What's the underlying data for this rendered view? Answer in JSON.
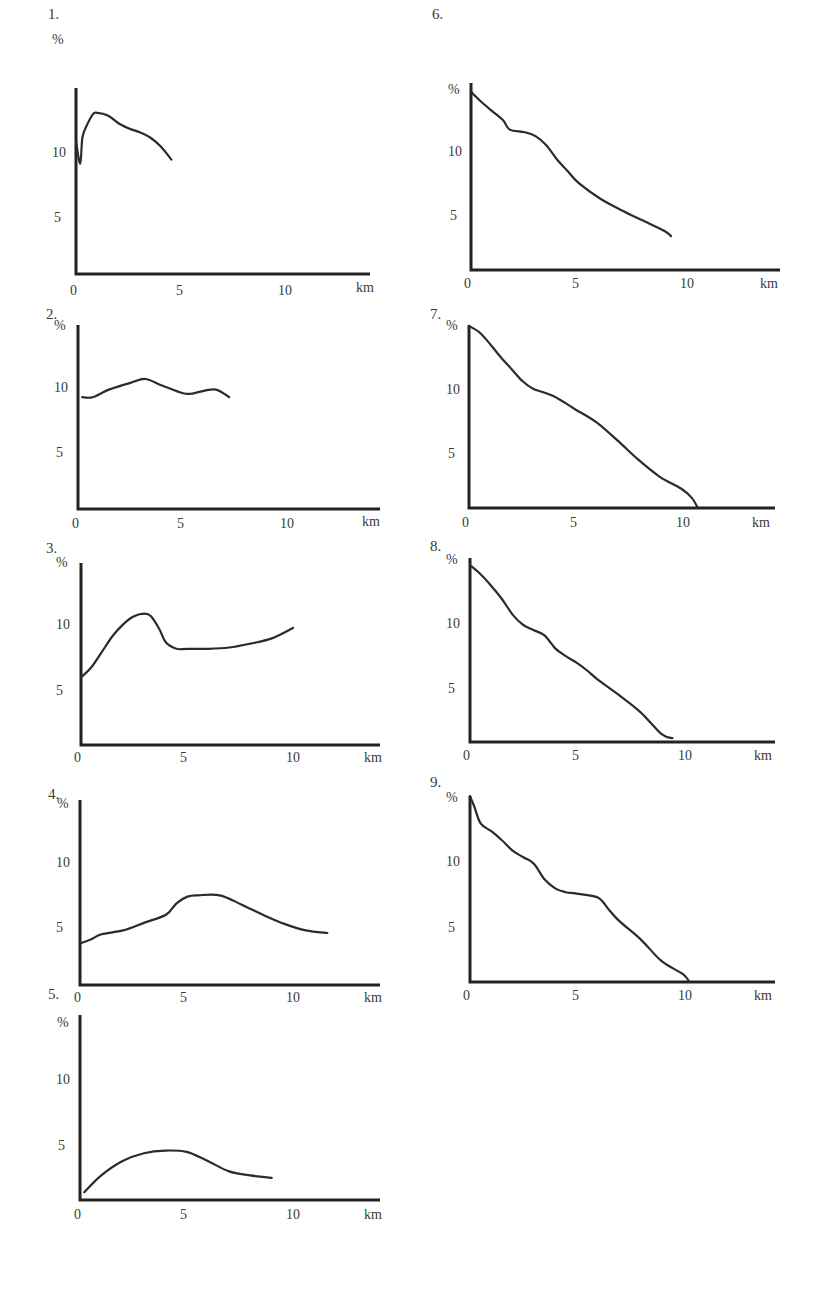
{
  "chart_data": [
    {
      "id": "1",
      "type": "line",
      "title": "1.",
      "ylabel": "%",
      "xlabel": "km",
      "xticks": [
        "0",
        "5",
        "10"
      ],
      "yticks": [
        "5",
        "10"
      ],
      "xlim": [
        0,
        14
      ],
      "ylim": [
        0,
        14
      ],
      "x": [
        0,
        0.2,
        0.3,
        0.5,
        0.8,
        1.0,
        1.5,
        2.0,
        2.5,
        3.0,
        3.5,
        4.0,
        4.5
      ],
      "values": [
        10.2,
        8.5,
        10.5,
        11.4,
        12.3,
        12.4,
        12.2,
        11.6,
        11.2,
        10.9,
        10.5,
        9.8,
        8.8
      ]
    },
    {
      "id": "2",
      "type": "line",
      "title": "2.",
      "ylabel": "%",
      "xlabel": "km",
      "xticks": [
        "0",
        "5",
        "10"
      ],
      "yticks": [
        "5",
        "10"
      ],
      "xlim": [
        0,
        14
      ],
      "ylim": [
        0,
        14
      ],
      "x": [
        0.2,
        0.7,
        1.5,
        2.5,
        3.2,
        4.0,
        5.0,
        5.5,
        6.5,
        7.2
      ],
      "values": [
        8.6,
        8.6,
        9.2,
        9.7,
        10.0,
        9.5,
        8.9,
        8.9,
        9.2,
        8.6
      ]
    },
    {
      "id": "3",
      "type": "line",
      "title": "3.",
      "ylabel": "%",
      "xlabel": "km",
      "xticks": [
        "0",
        "5",
        "10"
      ],
      "yticks": [
        "5",
        "10"
      ],
      "xlim": [
        0,
        14
      ],
      "ylim": [
        0,
        14
      ],
      "x": [
        0,
        0.5,
        1.0,
        1.5,
        2.0,
        2.5,
        3.0,
        3.3,
        3.7,
        4.0,
        4.5,
        5.0,
        6.0,
        7.0,
        8.0,
        9.0,
        10.0
      ],
      "values": [
        5.2,
        6.0,
        7.2,
        8.4,
        9.3,
        9.9,
        10.1,
        9.9,
        8.9,
        7.9,
        7.4,
        7.4,
        7.4,
        7.5,
        7.8,
        8.2,
        9.0
      ]
    },
    {
      "id": "4",
      "type": "line",
      "title": "4.",
      "ylabel": "%",
      "xlabel": "km",
      "xticks": [
        "0",
        "5",
        "10"
      ],
      "yticks": [
        "5",
        "10"
      ],
      "xlim": [
        0,
        14
      ],
      "ylim": [
        0,
        14
      ],
      "x": [
        0,
        0.5,
        1.0,
        2.0,
        3.0,
        4.0,
        4.5,
        5.0,
        5.5,
        6.5,
        7.5,
        8.5,
        9.5,
        10.5,
        11.5
      ],
      "values": [
        3.2,
        3.5,
        3.9,
        4.2,
        4.8,
        5.4,
        6.3,
        6.8,
        6.9,
        6.9,
        6.2,
        5.4,
        4.7,
        4.2,
        4.0
      ]
    },
    {
      "id": "5",
      "type": "line",
      "title": "5.",
      "ylabel": "%",
      "xlabel": "km",
      "xticks": [
        "0",
        "5",
        "10"
      ],
      "yticks": [
        "5",
        "10"
      ],
      "xlim": [
        0,
        14
      ],
      "ylim": [
        0,
        14
      ],
      "x": [
        0.2,
        1.0,
        2.0,
        3.0,
        4.0,
        5.0,
        6.0,
        7.0,
        8.0,
        9.0
      ],
      "values": [
        0.6,
        1.9,
        3.0,
        3.6,
        3.8,
        3.7,
        3.0,
        2.2,
        1.9,
        1.7
      ]
    },
    {
      "id": "6",
      "type": "line",
      "title": "6.",
      "ylabel": "%",
      "xlabel": "km",
      "xticks": [
        "0",
        "5",
        "10"
      ],
      "yticks": [
        "5",
        "10"
      ],
      "xlim": [
        0,
        14
      ],
      "ylim": [
        0,
        14
      ],
      "x": [
        0,
        0.5,
        1.0,
        1.5,
        1.8,
        2.5,
        3.0,
        3.5,
        4.0,
        4.5,
        5.0,
        6.0,
        7.0,
        8.0,
        9.0,
        9.3
      ],
      "values": [
        13.7,
        12.9,
        12.2,
        11.5,
        10.8,
        10.6,
        10.3,
        9.6,
        8.5,
        7.6,
        6.7,
        5.5,
        4.6,
        3.8,
        3.0,
        2.6
      ]
    },
    {
      "id": "7",
      "type": "line",
      "title": "7.",
      "ylabel": "%",
      "xlabel": "km",
      "xticks": [
        "0",
        "5",
        "10"
      ],
      "yticks": [
        "5",
        "10"
      ],
      "xlim": [
        0,
        14
      ],
      "ylim": [
        0,
        14
      ],
      "x": [
        0,
        0.5,
        1.0,
        1.5,
        2.0,
        2.5,
        3.0,
        4.0,
        5.0,
        6.0,
        7.0,
        8.0,
        9.0,
        10.0,
        10.5,
        10.8
      ],
      "values": [
        14.0,
        13.5,
        12.6,
        11.6,
        10.7,
        9.8,
        9.2,
        8.6,
        7.6,
        6.6,
        5.2,
        3.7,
        2.4,
        1.5,
        0.8,
        0
      ]
    },
    {
      "id": "8",
      "type": "line",
      "title": "8.",
      "ylabel": "%",
      "xlabel": "km",
      "xticks": [
        "0",
        "5",
        "10"
      ],
      "yticks": [
        "5",
        "10"
      ],
      "xlim": [
        0,
        14
      ],
      "ylim": [
        0,
        14
      ],
      "x": [
        0,
        0.5,
        1.0,
        1.5,
        2.0,
        2.5,
        3.0,
        3.5,
        4.0,
        4.5,
        5.0,
        5.5,
        6.0,
        7.0,
        8.0,
        9.0,
        9.5
      ],
      "values": [
        13.6,
        12.9,
        12.0,
        11.0,
        9.8,
        9.0,
        8.6,
        8.2,
        7.2,
        6.6,
        6.1,
        5.5,
        4.8,
        3.6,
        2.3,
        0.6,
        0.3
      ]
    },
    {
      "id": "9",
      "type": "line",
      "title": "9.",
      "ylabel": "%",
      "xlabel": "km",
      "xticks": [
        "0",
        "5",
        "10"
      ],
      "yticks": [
        "5",
        "10"
      ],
      "xlim": [
        0,
        14
      ],
      "ylim": [
        0,
        14
      ],
      "x": [
        0,
        0.2,
        0.5,
        1.0,
        1.5,
        2.0,
        2.5,
        3.0,
        3.5,
        4.0,
        4.5,
        5.0,
        6.0,
        6.5,
        7.0,
        8.0,
        9.0,
        10.0,
        10.3
      ],
      "values": [
        14.3,
        13.5,
        12.2,
        11.6,
        10.9,
        10.1,
        9.6,
        9.1,
        7.9,
        7.2,
        6.9,
        6.8,
        6.5,
        5.6,
        4.7,
        3.3,
        1.6,
        0.6,
        0
      ]
    }
  ],
  "figure": {
    "panel_labels": [
      "1.",
      "2.",
      "3.",
      "4.",
      "5.",
      "6.",
      "7.",
      "8.",
      "9."
    ],
    "y_unit": "%",
    "x_unit": "km",
    "caption": ""
  }
}
